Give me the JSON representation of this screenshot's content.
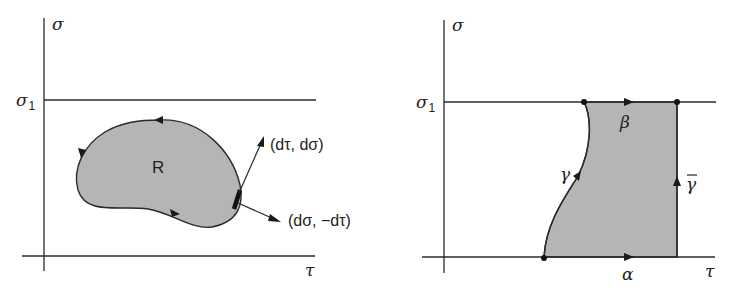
{
  "left_panel": {
    "y_axis_label": "σ",
    "x_axis_label": "τ",
    "level_label": "σ",
    "level_subscript": "1",
    "region_label": "R",
    "vector_tangent_label": "(dτ, dσ)",
    "vector_normal_label": "(dσ, −dτ)",
    "colors": {
      "region_fill": "#b5b5b5",
      "stroke": "#2a2a2a"
    }
  },
  "right_panel": {
    "y_axis_label": "σ",
    "x_axis_label": "τ",
    "level_label": "σ",
    "level_subscript": "1",
    "path_labels": {
      "alpha": "α",
      "beta": "β",
      "gamma": "γ",
      "gamma_bar": "γ"
    },
    "colors": {
      "region_fill": "#b5b5b5",
      "stroke": "#2a2a2a"
    }
  }
}
